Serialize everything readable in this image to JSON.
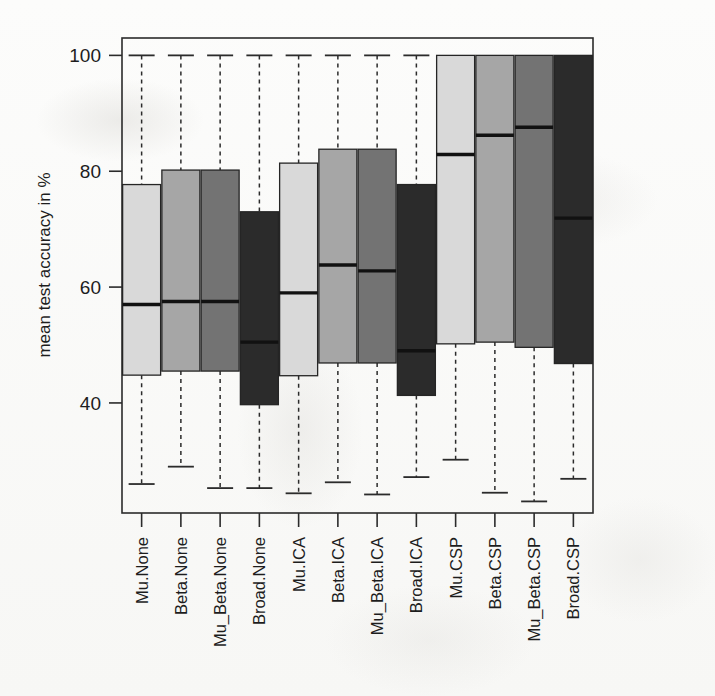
{
  "chart_data": {
    "type": "box",
    "title": "",
    "xlabel": "",
    "ylabel": "mean test accuracy in %",
    "ylim": [
      21,
      103
    ],
    "yticks": [
      40,
      60,
      80,
      100
    ],
    "ytick_labels": [
      "40",
      "60",
      "80",
      "100"
    ],
    "grid": false,
    "legend": "none",
    "categories": [
      "Mu.None",
      "Beta.None",
      "Mu_Beta.None",
      "Broad.None",
      "Mu.ICA",
      "Beta.ICA",
      "Mu_Beta.ICA",
      "Broad.ICA",
      "Mu.CSP",
      "Beta.CSP",
      "Mu_Beta.CSP",
      "Broad.CSP"
    ],
    "fill_colors": [
      "#d9d9d9",
      "#a6a6a6",
      "#737373",
      "#2b2b2b"
    ],
    "boxes": [
      {
        "label": "Mu.None",
        "fill": "#d9d9d9",
        "whisker_low": 26.0,
        "q1": 44.8,
        "median": 57.0,
        "q3": 77.7,
        "whisker_high": 100.0
      },
      {
        "label": "Beta.None",
        "fill": "#a6a6a6",
        "whisker_low": 29.0,
        "q1": 45.5,
        "median": 57.5,
        "q3": 80.2,
        "whisker_high": 100.0
      },
      {
        "label": "Mu_Beta.None",
        "fill": "#737373",
        "whisker_low": 25.3,
        "q1": 45.5,
        "median": 57.5,
        "q3": 80.2,
        "whisker_high": 100.0
      },
      {
        "label": "Broad.None",
        "fill": "#2b2b2b",
        "whisker_low": 25.3,
        "q1": 39.7,
        "median": 50.5,
        "q3": 73.0,
        "whisker_high": 100.0
      },
      {
        "label": "Mu.ICA",
        "fill": "#d9d9d9",
        "whisker_low": 24.4,
        "q1": 44.7,
        "median": 59.0,
        "q3": 81.4,
        "whisker_high": 100.0
      },
      {
        "label": "Beta.ICA",
        "fill": "#a6a6a6",
        "whisker_low": 26.3,
        "q1": 46.9,
        "median": 63.8,
        "q3": 83.8,
        "whisker_high": 100.0
      },
      {
        "label": "Mu_Beta.ICA",
        "fill": "#737373",
        "whisker_low": 24.2,
        "q1": 46.9,
        "median": 62.8,
        "q3": 83.8,
        "whisker_high": 100.0
      },
      {
        "label": "Broad.ICA",
        "fill": "#2b2b2b",
        "whisker_low": 27.2,
        "q1": 41.3,
        "median": 49.0,
        "q3": 77.7,
        "whisker_high": 100.0
      },
      {
        "label": "Mu.CSP",
        "fill": "#d9d9d9",
        "whisker_low": 30.2,
        "q1": 50.2,
        "median": 82.9,
        "q3": 100.0,
        "whisker_high": 100.0
      },
      {
        "label": "Beta.CSP",
        "fill": "#a6a6a6",
        "whisker_low": 24.5,
        "q1": 50.5,
        "median": 86.2,
        "q3": 100.0,
        "whisker_high": 100.0
      },
      {
        "label": "Mu_Beta.CSP",
        "fill": "#737373",
        "whisker_low": 23.0,
        "q1": 49.6,
        "median": 87.6,
        "q3": 100.0,
        "whisker_high": 100.0
      },
      {
        "label": "Broad.CSP",
        "fill": "#2b2b2b",
        "whisker_low": 26.9,
        "q1": 46.8,
        "median": 71.9,
        "q3": 100.0,
        "whisker_high": 100.0
      }
    ]
  },
  "axes": {
    "y_title": "mean test accuracy in %"
  }
}
